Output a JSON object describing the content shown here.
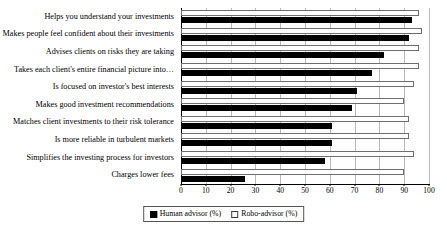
{
  "chart_data": {
    "type": "bar",
    "orientation": "horizontal",
    "title": "",
    "xlabel": "",
    "ylabel": "",
    "xlim": [
      0,
      100
    ],
    "xticks": [
      0,
      10,
      20,
      30,
      40,
      50,
      60,
      70,
      80,
      90,
      100
    ],
    "grid": true,
    "legend_position": "bottom-center",
    "categories": [
      "Helps you understand your investments",
      "Makes people feel confident about their investments",
      "Advises clients on risks they are taking",
      "Takes each client's entire financial picture into…",
      "Is focused on investor's best interests",
      "Makes good investment recommendations",
      "Matches client investments to their risk tolerance",
      "Is more reliable in turbulent markets",
      "Simplifies the investing process for investors",
      "Charges lower fees"
    ],
    "series": [
      {
        "name": "Human advisor (%)",
        "color": "#000000",
        "values": [
          93,
          92,
          82,
          77,
          71,
          69,
          61,
          61,
          58,
          26
        ]
      },
      {
        "name": "Robo-advisor (%)",
        "color": "#ffffff",
        "values": [
          96,
          97,
          96,
          96,
          94,
          90,
          92,
          92,
          94,
          90
        ]
      }
    ]
  },
  "legend": {
    "items": [
      {
        "label": "Human advisor (%)",
        "swatch": "filled-black-square"
      },
      {
        "label": "Robo-advisor (%)",
        "swatch": "hollow-white-square"
      }
    ]
  }
}
